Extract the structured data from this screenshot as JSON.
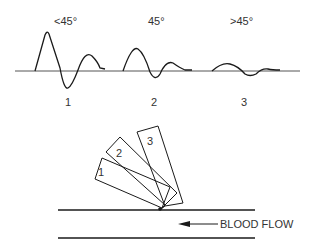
{
  "diagram": {
    "type": "doppler-angle-illustration",
    "waveforms": [
      {
        "id": "1",
        "angle_label": "<45°",
        "number_label": "1"
      },
      {
        "id": "2",
        "angle_label": "45°",
        "number_label": "2"
      },
      {
        "id": "3",
        "angle_label": ">45°",
        "number_label": "3"
      }
    ],
    "probes": [
      {
        "id": "1",
        "label": "1"
      },
      {
        "id": "2",
        "label": "2"
      },
      {
        "id": "3",
        "label": "3"
      }
    ],
    "vessel": {
      "flow_label": "BLOOD FLOW",
      "flow_direction": "left"
    },
    "colors": {
      "line": "#1a1a1a",
      "baseline": "#555555",
      "text": "#333333",
      "background": "#ffffff"
    }
  }
}
